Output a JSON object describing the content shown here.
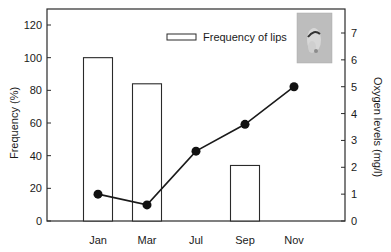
{
  "chart_data": {
    "type": "bar+line",
    "title": "",
    "categories": [
      "Jan",
      "Mar",
      "Jul",
      "Sep",
      "Nov"
    ],
    "xlabel": "",
    "ylabel": "Frequency (%)",
    "y2label": "Oxygen levels (mg/l)",
    "ylim": [
      0,
      120
    ],
    "y2lim": [
      0,
      7
    ],
    "yticks": [
      0,
      20,
      40,
      60,
      80,
      100,
      120
    ],
    "y2ticks": [
      0,
      1,
      2,
      3,
      4,
      5,
      6,
      7
    ],
    "grid": false,
    "legend_position": "upper right",
    "series": [
      {
        "name": "Frequency of lips",
        "type": "bar",
        "axis": "left",
        "values": [
          100,
          84,
          0,
          34,
          0
        ]
      },
      {
        "name": "Oxygen levels",
        "type": "line",
        "axis": "right",
        "marker": "filled-circle",
        "values": [
          1.0,
          0.6,
          2.6,
          3.6,
          5.0
        ]
      }
    ],
    "annotations": [
      "inset photograph of fish with lips (upper right)"
    ]
  },
  "legend": {
    "bar_label": "Frequency of lips"
  },
  "colors": {
    "axis": "#2a2a2a",
    "bar_fill": "#ffffff",
    "bar_stroke": "#2a2a2a",
    "line": "#1a1a1a",
    "marker": "#111111",
    "photo_bg": "#b9b9b9"
  }
}
